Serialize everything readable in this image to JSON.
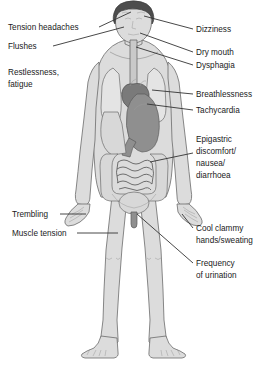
{
  "figure": {
    "background_color": "#ffffff",
    "label_color": "#1a1a1a",
    "leader_line_color": "#333333"
  },
  "labels_left": [
    {
      "id": "tension-headaches",
      "text": "Tension headaches",
      "x": 8,
      "y": 30,
      "lines": [
        "Tension headaches"
      ]
    },
    {
      "id": "flushes",
      "text": "Flushes",
      "x": 8,
      "y": 49,
      "lines": [
        "Flushes"
      ]
    },
    {
      "id": "restlessness-fatigue",
      "text": "Restlessness, fatigue",
      "x": 8,
      "y": 75,
      "lines": [
        "Restlessness,",
        "fatigue"
      ]
    },
    {
      "id": "trembling",
      "text": "Trembling",
      "x": 12,
      "y": 217,
      "lines": [
        "Trembling"
      ]
    },
    {
      "id": "muscle-tension",
      "text": "Muscle tension",
      "x": 12,
      "y": 236,
      "lines": [
        "Muscle tension"
      ]
    }
  ],
  "labels_right": [
    {
      "id": "dizziness",
      "text": "Dizziness",
      "x": 196,
      "y": 32,
      "lines": [
        "Dizziness"
      ]
    },
    {
      "id": "dry-mouth",
      "text": "Dry mouth",
      "x": 196,
      "y": 55,
      "lines": [
        "Dry mouth"
      ]
    },
    {
      "id": "dysphagia",
      "text": "Dysphagia",
      "x": 196,
      "y": 68,
      "lines": [
        "Dysphagia"
      ]
    },
    {
      "id": "breathlessness",
      "text": "Breathlessness",
      "x": 196,
      "y": 97,
      "lines": [
        "Breathlessness"
      ]
    },
    {
      "id": "tachycardia",
      "text": "Tachycardia",
      "x": 196,
      "y": 113,
      "lines": [
        "Tachycardia"
      ]
    },
    {
      "id": "epigastric-discomfort",
      "text": "Epigastric discomfort/ nausea/ diarrhoea",
      "x": 196,
      "y": 142,
      "lines": [
        "Epigastric",
        "discomfort/",
        "nausea/",
        "diarrhoea"
      ]
    },
    {
      "id": "cool-clammy-hands",
      "text": "Cool clammy hands/sweating",
      "x": 196,
      "y": 231,
      "lines": [
        "Cool clammy",
        "hands/sweating"
      ]
    },
    {
      "id": "frequency-of-urination",
      "text": "Frequency of urination",
      "x": 196,
      "y": 266,
      "lines": [
        "Frequency",
        "of urination"
      ]
    }
  ],
  "body_parts": [
    {
      "id": "head",
      "name": "head"
    },
    {
      "id": "hair",
      "name": "hair"
    },
    {
      "id": "neck",
      "name": "neck"
    },
    {
      "id": "torso",
      "name": "torso"
    },
    {
      "id": "left-arm",
      "name": "left-arm"
    },
    {
      "id": "right-arm",
      "name": "right-arm"
    },
    {
      "id": "left-leg",
      "name": "left-leg"
    },
    {
      "id": "right-leg",
      "name": "right-leg"
    }
  ],
  "organs": [
    {
      "id": "lungs",
      "name": "lungs"
    },
    {
      "id": "heart",
      "name": "heart"
    },
    {
      "id": "oesophagus",
      "name": "oesophagus"
    },
    {
      "id": "stomach",
      "name": "stomach"
    },
    {
      "id": "liver",
      "name": "liver"
    },
    {
      "id": "large-intestine",
      "name": "large-intestine"
    },
    {
      "id": "small-intestine",
      "name": "small-intestine"
    },
    {
      "id": "bladder",
      "name": "bladder"
    }
  ]
}
